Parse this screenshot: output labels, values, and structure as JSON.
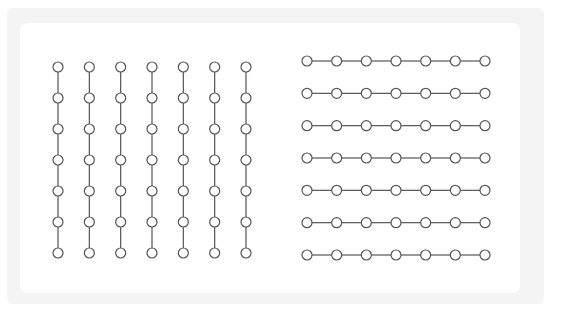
{
  "diagram": {
    "type": "node-grid-comparison",
    "node_style": {
      "radius": 5,
      "stroke": "#555555",
      "fill": "#ffffff",
      "edge_color": "#555555"
    },
    "panels": [
      {
        "name": "vertical-chains",
        "orientation": "vertical",
        "columns": 7,
        "rows": 7,
        "x_start": 58,
        "x_end": 246,
        "y_start": 67,
        "y_end": 253
      },
      {
        "name": "horizontal-chains",
        "orientation": "horizontal",
        "columns": 7,
        "rows": 7,
        "x_start": 307,
        "x_end": 485,
        "y_start": 61,
        "y_end": 255
      }
    ]
  }
}
